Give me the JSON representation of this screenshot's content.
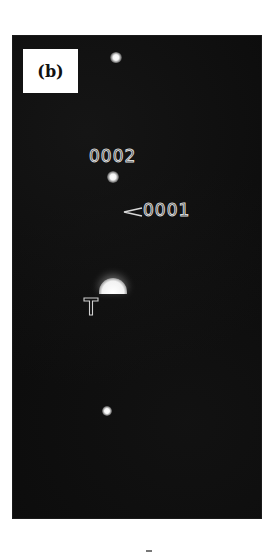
{
  "figure": {
    "panel_label": "(b)",
    "annotations": {
      "reflection_0002": "0002",
      "reflection_0001": "0001",
      "beam_stop_marker": "T"
    },
    "spots": [
      {
        "name": "upper-reflection",
        "x": 116,
        "y": 58,
        "size": 10
      },
      {
        "name": "reflection-0002",
        "x": 113,
        "y": 177,
        "size": 11
      },
      {
        "name": "transmitted-beam",
        "x": 112,
        "y": 290,
        "size": 28
      },
      {
        "name": "lower-reflection",
        "x": 107,
        "y": 411,
        "size": 9
      }
    ],
    "colors": {
      "background": "#ffffff",
      "panel": "#0b0b0b",
      "spot": "#ffffff",
      "annotation_stroke": "#d8d8d8"
    }
  }
}
